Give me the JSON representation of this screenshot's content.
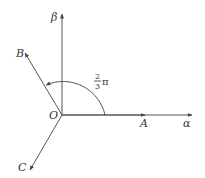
{
  "diagram": {
    "type": "vector-angle-diagram",
    "origin_label": "O",
    "axes": {
      "horizontal": {
        "label": "α"
      },
      "vertical": {
        "label": "β"
      }
    },
    "vectors": [
      {
        "name": "A",
        "label": "A",
        "direction": "along α-axis"
      },
      {
        "name": "B",
        "label": "B",
        "direction": "upper-left, 120° from α-axis"
      },
      {
        "name": "C",
        "label": "C",
        "direction": "lower-left"
      }
    ],
    "angle_annotation": {
      "from": "α-axis (OA)",
      "to": "OB",
      "numerator": "2",
      "denominator": "3",
      "symbol": "π",
      "text": "2/3 π"
    },
    "colors": {
      "stroke": "#555555",
      "text": "#333333",
      "background": "#ffffff"
    }
  }
}
